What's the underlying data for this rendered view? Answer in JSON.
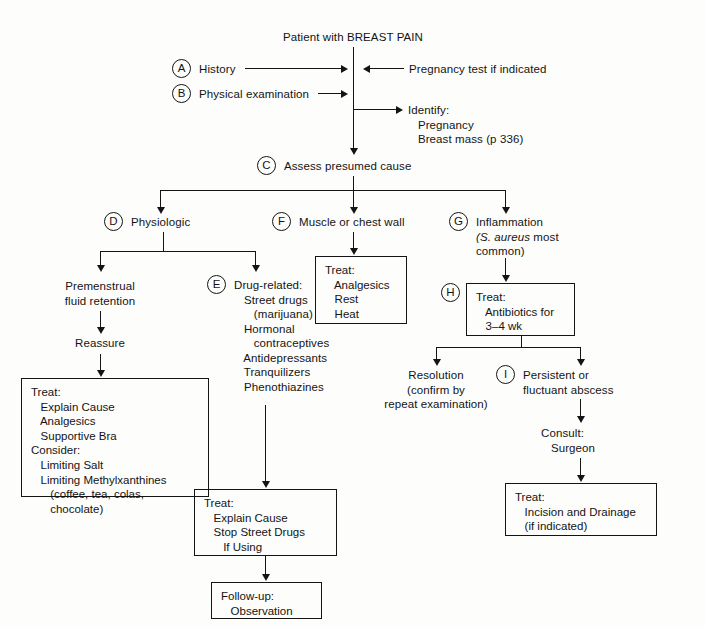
{
  "diagram": {
    "title": "Patient with BREAST PAIN",
    "type": "clinical-algorithm-flowchart",
    "nodes": {
      "root": {
        "label": "Patient with BREAST PAIN"
      },
      "a": {
        "letter": "A",
        "label": "History"
      },
      "b": {
        "letter": "B",
        "label": "Physical examination"
      },
      "pregnancy_test": {
        "label": "Pregnancy test if indicated"
      },
      "identify": {
        "label": "Identify:\n   Pregnancy\n   Breast mass (p 336)"
      },
      "c": {
        "letter": "C",
        "label": "Assess presumed cause"
      },
      "d": {
        "letter": "D",
        "label": "Physiologic"
      },
      "f": {
        "letter": "F",
        "label": "Muscle or chest wall"
      },
      "g": {
        "letter": "G",
        "label": "Inflammation",
        "sub_italic": "(S. aureus",
        "sub_rest": " most",
        "sub_line2": "common)"
      },
      "premenstrual": {
        "label": "Premenstrual\nfluid retention"
      },
      "reassure": {
        "label": "Reassure"
      },
      "e": {
        "letter": "E",
        "label": "Drug-related:\n   Street drugs\n      (marijuana)\n   Hormonal\n      contraceptives\n   Antidepressants\n   Tranquilizers\n   Phenothiazines"
      },
      "treat_physiologic": {
        "label": "Treat:\n   Explain Cause\n   Analgesics\n   Supportive Bra\nConsider:\n   Limiting Salt\n   Limiting Methylxanthines\n      (coffee, tea, colas,\n      chocolate)"
      },
      "treat_muscle": {
        "label": "Treat:\n   Analgesics\n   Rest\n   Heat"
      },
      "treat_drug": {
        "label": "Treat:\n   Explain Cause\n   Stop Street Drugs\n      If Using"
      },
      "followup": {
        "label": "Follow-up:\n   Observation"
      },
      "h": {
        "letter": "H",
        "label": "Treat:\n   Antibiotics for\n   3–4 wk"
      },
      "resolution": {
        "label": "Resolution\n(confirm by\nrepeat examination)"
      },
      "i": {
        "letter": "I",
        "label": "Persistent or\nfluctuant abscess"
      },
      "consult": {
        "label": "Consult:\n   Surgeon"
      },
      "treat_incision": {
        "label": "Treat:\n   Incision and Drainage\n   (if indicated)"
      }
    },
    "colors": {
      "line": "#141414",
      "text": "#141414",
      "background": "#fdfdfc"
    }
  }
}
